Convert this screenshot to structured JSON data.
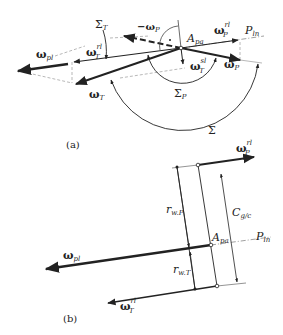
{
  "figure": {
    "panel_a": {
      "caption": "(a)",
      "labels": {
        "sigma_T": "Σ",
        "sigma_T_sub": "T",
        "neg_omega_P": "−ω",
        "neg_omega_P_sub": "P",
        "A_pa": "A",
        "A_pa_sub": "pa",
        "omega_P_rl": "ω",
        "omega_P_rl_sub": "P",
        "omega_P_rl_sup": "rl",
        "P_ln": "P",
        "P_ln_sub": "ln",
        "omega_T_rl": "ω",
        "omega_T_rl_sub": "T",
        "omega_T_rl_sup": "rl",
        "omega_pl": "ω",
        "omega_pl_sub": "pl",
        "omega_T_sl": "ω",
        "omega_T_sl_sub": "T",
        "omega_T_sl_sup": "sl",
        "omega_P": "ω",
        "omega_P_sub": "P",
        "omega_T": "ω",
        "omega_T_sub": "T",
        "sigma_P": "Σ",
        "sigma_P_sub": "P",
        "sigma": "Σ"
      }
    },
    "panel_b": {
      "caption": "(b)",
      "labels": {
        "omega_P_rl": "ω",
        "omega_P_rl_sub": "P",
        "omega_P_rl_sup": "rl",
        "r_wP": "r",
        "r_wP_sub": "w.P",
        "C_gc": "C",
        "C_gc_sub": "g/c",
        "P_ln": "P",
        "P_ln_sub": "ln",
        "A_pa": "A",
        "A_pa_sub": "pa",
        "omega_pl": "ω",
        "omega_pl_sub": "pl",
        "r_wT": "r",
        "r_wT_sub": "w.T",
        "omega_T_rl": "ω",
        "omega_T_rl_sub": "T",
        "omega_T_rl_sup": "rl"
      }
    }
  }
}
